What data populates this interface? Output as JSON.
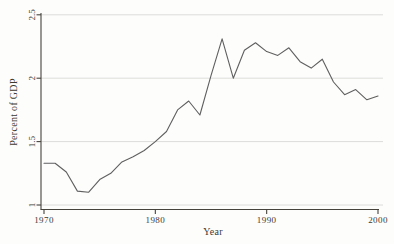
{
  "chart_data": {
    "type": "line",
    "title": "",
    "xlabel": "Year",
    "ylabel": "Percent of GDP",
    "xlim": [
      1970,
      2000
    ],
    "ylim": [
      1,
      2.5
    ],
    "x_ticks": [
      1970,
      1980,
      1990,
      2000
    ],
    "y_ticks": [
      1,
      1.5,
      2,
      2.5
    ],
    "y_tick_labels": [
      "1",
      "1.5",
      "2",
      "2.5"
    ],
    "grid": "horizontal gridlines at each y tick",
    "legend": "none",
    "x": [
      1970,
      1971,
      1972,
      1973,
      1974,
      1975,
      1976,
      1977,
      1978,
      1979,
      1980,
      1981,
      1982,
      1983,
      1984,
      1985,
      1986,
      1987,
      1988,
      1989,
      1990,
      1991,
      1992,
      1993,
      1994,
      1995,
      1996,
      1997,
      1998,
      1999,
      2000
    ],
    "values": [
      1.33,
      1.33,
      1.26,
      1.11,
      1.1,
      1.2,
      1.25,
      1.34,
      1.38,
      1.43,
      1.5,
      1.58,
      1.75,
      1.82,
      1.71,
      2.02,
      2.31,
      2.0,
      2.22,
      2.28,
      2.21,
      2.18,
      2.24,
      2.13,
      2.08,
      2.15,
      1.97,
      1.87,
      1.91,
      1.83,
      1.86
    ]
  },
  "style": {
    "line_color": "#5f5f5f",
    "grid_color": "#dcdcda",
    "axis_color": "#46433c",
    "text_color": "#3d3a33",
    "background": "#fdfdfc"
  }
}
